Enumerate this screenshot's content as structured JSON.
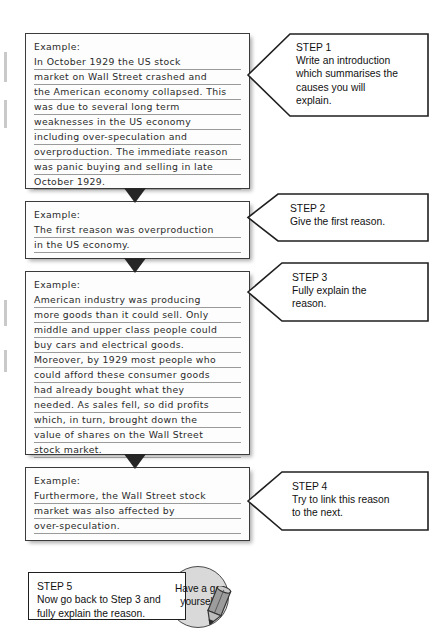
{
  "document": {
    "title": "Writing an explanation - step by step example (Wall Street Crash)"
  },
  "examples": [
    {
      "name": "example-1",
      "heading": "Example:",
      "lines": [
        "In October 1929 the US stock",
        "market on Wall Street crashed and",
        "the American economy collapsed. This",
        "was due to several long term",
        "weaknesses in the US economy",
        "including over-speculation and",
        "overproduction. The immediate reason",
        "was panic buying and selling in late",
        "October 1929."
      ]
    },
    {
      "name": "example-2",
      "heading": "Example:",
      "lines": [
        "The first reason was overproduction",
        "in the US economy."
      ]
    },
    {
      "name": "example-3",
      "heading": "Example:",
      "lines": [
        "American industry was producing",
        "more goods than it could sell. Only",
        "middle and upper class people could",
        "buy cars and electrical goods.",
        "Moreover, by 1929 most people who",
        "could afford these consumer goods",
        "had already bought what they",
        "needed. As sales fell, so did profits",
        "which, in turn, brought down the",
        "value of shares on the Wall Street",
        "stock market."
      ]
    },
    {
      "name": "example-4",
      "heading": "Example:",
      "lines": [
        "Furthermore, the Wall Street stock",
        "market was also affected by",
        "over-speculation."
      ]
    }
  ],
  "steps": [
    {
      "label": "STEP 1",
      "description": "Write an introduction which summarises the causes you will explain.",
      "lines": [
        "Write an introduction",
        "which summarises the",
        "causes you will",
        "explain."
      ]
    },
    {
      "label": "STEP 2",
      "description": "Give the first reason.",
      "lines": [
        "Give the first reason."
      ]
    },
    {
      "label": "STEP 3",
      "description": "Fully explain the reason.",
      "lines": [
        "Fully explain the",
        "reason."
      ]
    },
    {
      "label": "STEP 4",
      "description": "Try to link this reason to the next.",
      "lines": [
        "Try to link this reason",
        "to the next."
      ]
    },
    {
      "label": "STEP 5",
      "description": "Now go back to Step 3 and fully explain the reason.",
      "lines": [
        "Now go back to Step 3 and",
        "fully explain the reason."
      ]
    }
  ],
  "activity_badge": {
    "line1": "Have a go",
    "line2": "yourself",
    "icon": "pencil-icon"
  },
  "colors": {
    "ink": "#2a2a2a",
    "rule": "#9a9a9a",
    "box_border": "#3b3b3b",
    "arrow": "#262626",
    "badge_fill": "#d9d9d9"
  }
}
